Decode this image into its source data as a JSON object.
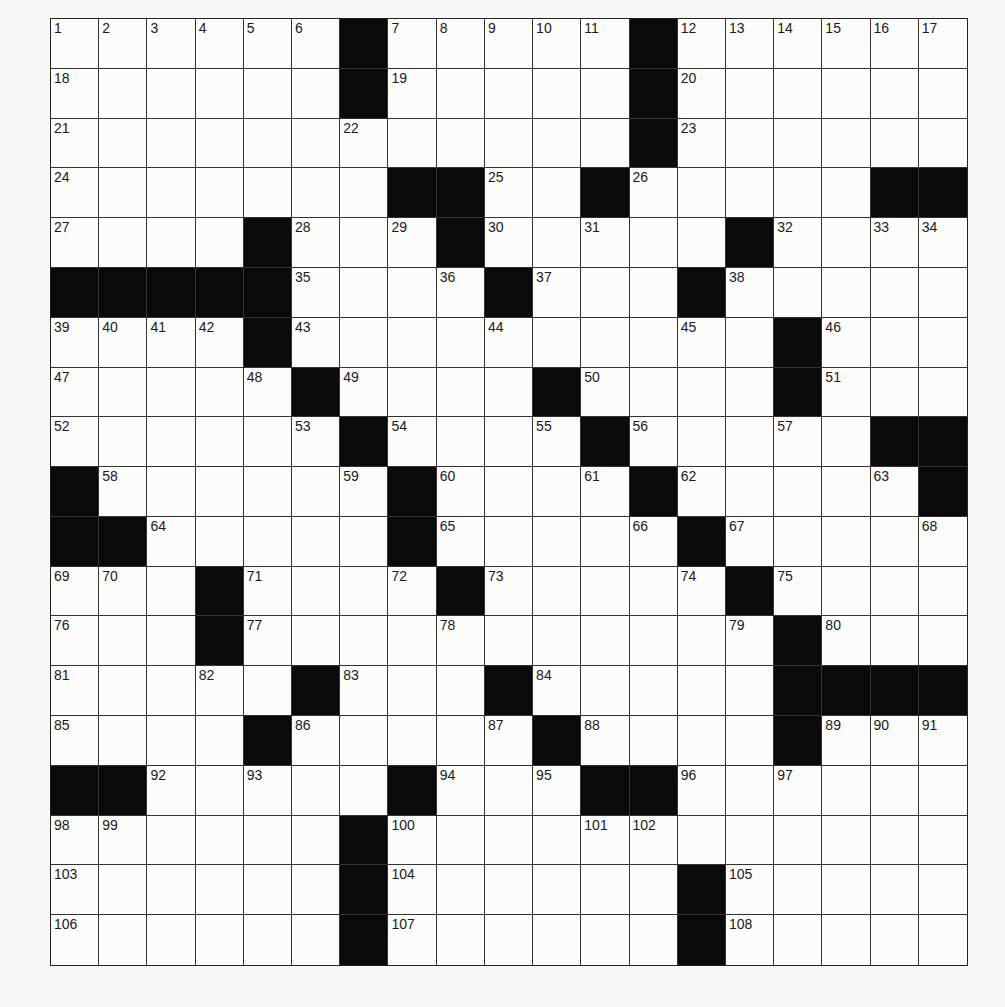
{
  "puzzle": {
    "rows": 19,
    "cols": 19,
    "colors": {
      "black": "#0a0a0a",
      "white": "#fcfcfa",
      "line": "#333333"
    },
    "black_cells": {
      "0": [
        6,
        12
      ],
      "1": [
        6,
        12
      ],
      "2": [
        12
      ],
      "3": [
        7,
        8,
        11,
        17,
        18
      ],
      "4": [
        4,
        8,
        14
      ],
      "5": [
        0,
        1,
        2,
        3,
        4,
        9,
        13
      ],
      "6": [
        4,
        15
      ],
      "7": [
        5,
        10,
        15
      ],
      "8": [
        6,
        11,
        17,
        18
      ],
      "9": [
        0,
        7,
        12,
        18
      ],
      "10": [
        0,
        1,
        7,
        13
      ],
      "11": [
        3,
        8,
        14
      ],
      "12": [
        3,
        15
      ],
      "13": [
        5,
        9,
        15,
        16,
        17,
        18
      ],
      "14": [
        4,
        10,
        15
      ],
      "15": [
        0,
        1,
        7,
        11,
        12
      ],
      "16": [
        6
      ],
      "17": [
        6,
        13
      ],
      "18": [
        6,
        13
      ]
    },
    "max_number": 109
  }
}
